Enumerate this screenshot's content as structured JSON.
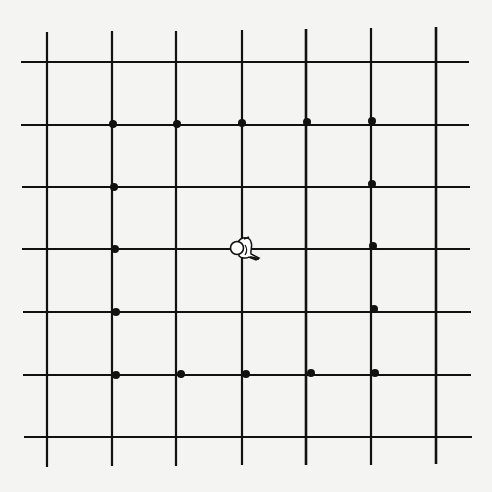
{
  "board": {
    "background": "#f4f4f3",
    "line_color": "#111111",
    "vertical_lines": [
      {
        "x": 47,
        "y1": 32,
        "y2": 467
      },
      {
        "x": 112,
        "y1": 31,
        "y2": 466
      },
      {
        "x": 176,
        "y1": 31,
        "y2": 466
      },
      {
        "x": 242,
        "y1": 30,
        "y2": 465
      },
      {
        "x": 306,
        "y1": 29,
        "y2": 465
      },
      {
        "x": 371,
        "y1": 28,
        "y2": 465
      },
      {
        "x": 436,
        "y1": 27,
        "y2": 464
      }
    ],
    "horizontal_lines": [
      {
        "y": 62,
        "x1": 21,
        "x2": 469
      },
      {
        "y": 125,
        "x1": 21,
        "x2": 469
      },
      {
        "y": 187,
        "x1": 22,
        "x2": 470
      },
      {
        "y": 249,
        "x1": 22,
        "x2": 470
      },
      {
        "y": 312,
        "x1": 23,
        "x2": 471
      },
      {
        "y": 375,
        "x1": 23,
        "x2": 471
      },
      {
        "y": 437,
        "x1": 24,
        "x2": 472
      }
    ],
    "dots": [
      {
        "x": 113,
        "y": 124
      },
      {
        "x": 177,
        "y": 124
      },
      {
        "x": 242,
        "y": 123
      },
      {
        "x": 307,
        "y": 122
      },
      {
        "x": 372,
        "y": 121
      },
      {
        "x": 114,
        "y": 187
      },
      {
        "x": 372,
        "y": 184
      },
      {
        "x": 115,
        "y": 249
      },
      {
        "x": 373,
        "y": 246
      },
      {
        "x": 116,
        "y": 312
      },
      {
        "x": 374,
        "y": 309
      },
      {
        "x": 116,
        "y": 375
      },
      {
        "x": 181,
        "y": 374
      },
      {
        "x": 246,
        "y": 374
      },
      {
        "x": 311,
        "y": 373
      },
      {
        "x": 375,
        "y": 373
      }
    ],
    "player": {
      "x": 242,
      "y": 249,
      "icon": "figure-top-down-icon"
    }
  }
}
